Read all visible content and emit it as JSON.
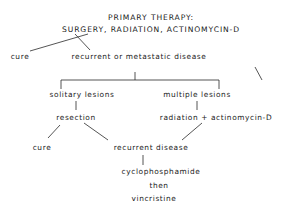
{
  "diagram": {
    "type": "treatment-flowchart",
    "nodes": {
      "title_line1": "PRIMARY THERAPY:",
      "title_line2": "SURGERY, RADIATION, ACTINOMYCIN-D",
      "cure_1": "cure",
      "recurrent_or_metastatic": "recurrent or metastatic disease",
      "solitary_lesions": "solitary lesions",
      "multiple_lesions": "multiple lesions",
      "resection": "resection",
      "radiation_actinomycin": "radiation + actinomycin-D",
      "cure_2": "cure",
      "recurrent_disease": "recurrent disease",
      "cyclophosphamide": "cyclophosphamide",
      "then": "then",
      "vincristine": "vincristine"
    },
    "edges": [
      {
        "from": "primary_therapy",
        "to": "cure_1"
      },
      {
        "from": "primary_therapy",
        "to": "recurrent_or_metastatic"
      },
      {
        "from": "recurrent_or_metastatic",
        "to": "solitary_lesions"
      },
      {
        "from": "recurrent_or_metastatic",
        "to": "multiple_lesions"
      },
      {
        "from": "solitary_lesions",
        "to": "resection"
      },
      {
        "from": "multiple_lesions",
        "to": "radiation_actinomycin"
      },
      {
        "from": "resection",
        "to": "cure_2"
      },
      {
        "from": "resection",
        "to": "recurrent_disease"
      },
      {
        "from": "radiation_actinomycin",
        "to": "recurrent_disease"
      },
      {
        "from": "recurrent_disease",
        "to": "cyclophosphamide"
      }
    ]
  }
}
